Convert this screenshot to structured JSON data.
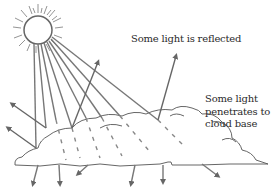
{
  "diagram": {
    "labels": {
      "reflected": "Some light is reflected",
      "penetrates_line1": "Some light",
      "penetrates_line2": "penetrates to",
      "penetrates_line3": "cloud base"
    },
    "elements": {
      "sun": "sun-icon",
      "cloud": "cloud-shape",
      "incoming_rays": 8,
      "reflected_arrows": 4,
      "transmitted_arrows": 6
    },
    "colors": {
      "ink": "#555555",
      "text": "#2a2a2a",
      "background": "#ffffff"
    }
  }
}
